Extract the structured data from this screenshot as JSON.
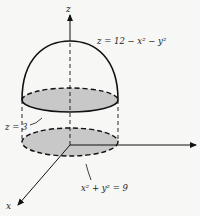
{
  "figure": {
    "axes": {
      "z_label": "z",
      "x_label": "x"
    },
    "labels": {
      "surface": "z = 12 − x² − y²",
      "plane": "z = 3",
      "region": "x² + y² = 9"
    },
    "colors": {
      "background": "#f7f7f5",
      "stroke": "#111111",
      "fill": "#c8c8c8"
    }
  }
}
